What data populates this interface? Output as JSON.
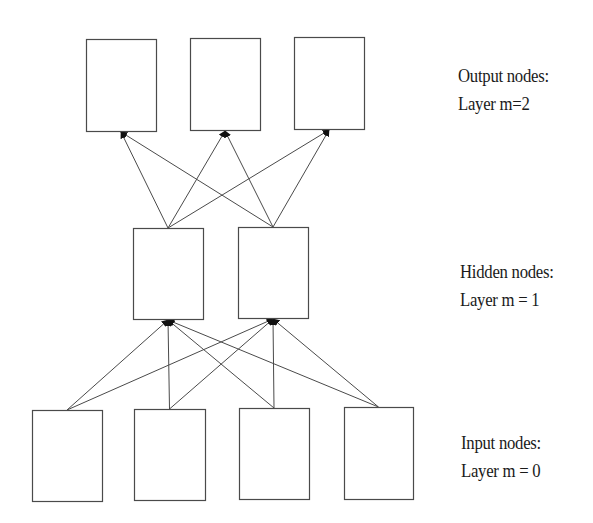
{
  "colors": {
    "background": "#ffffff",
    "stroke": "#4a4a4a",
    "arrowhead": "#111111",
    "text": "#1a1a1a"
  },
  "layers": [
    {
      "id": "output",
      "title": "Output nodes:",
      "subtitle": "Layer m=2",
      "label_pos": [
        458,
        62
      ],
      "nodes": [
        {
          "x": 86,
          "y": 39,
          "w": 70,
          "h": 92
        },
        {
          "x": 190,
          "y": 38,
          "w": 70,
          "h": 92
        },
        {
          "x": 294,
          "y": 37,
          "w": 70,
          "h": 92
        }
      ]
    },
    {
      "id": "hidden",
      "title": "Hidden nodes:",
      "subtitle": "Layer m = 1",
      "label_pos": [
        460,
        258
      ],
      "nodes": [
        {
          "x": 133,
          "y": 228,
          "w": 70,
          "h": 91
        },
        {
          "x": 238,
          "y": 227,
          "w": 70,
          "h": 91
        }
      ]
    },
    {
      "id": "input",
      "title": "Input nodes:",
      "subtitle": "Layer m = 0",
      "label_pos": [
        461,
        429
      ],
      "nodes": [
        {
          "x": 32,
          "y": 410,
          "w": 70,
          "h": 91
        },
        {
          "x": 134,
          "y": 409,
          "w": 71,
          "h": 91
        },
        {
          "x": 239,
          "y": 408,
          "w": 70,
          "h": 91
        },
        {
          "x": 344,
          "y": 407,
          "w": 69,
          "h": 92
        }
      ]
    }
  ],
  "edges": {
    "input_to_hidden": "fully-connected",
    "hidden_to_output": "fully-connected",
    "direction": "upward"
  }
}
